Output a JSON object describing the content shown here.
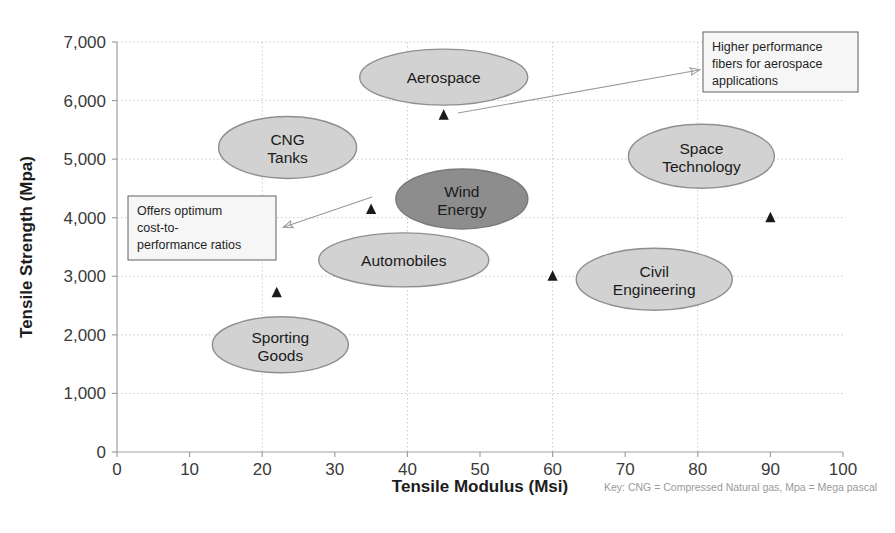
{
  "chart_data": {
    "type": "scatter",
    "title": "",
    "xlabel": "Tensile Modulus (Msi)",
    "ylabel": "Tensile Strength (Mpa)",
    "xlim": [
      0,
      100
    ],
    "ylim": [
      0,
      7000
    ],
    "xticks": [
      "0",
      "10",
      "20",
      "30",
      "40",
      "50",
      "60",
      "70",
      "80",
      "90",
      "100"
    ],
    "yticks": [
      "0",
      "1,000",
      "2,000",
      "3,000",
      "4,000",
      "5,000",
      "6,000",
      "7,000"
    ],
    "grid": true,
    "legend": "none",
    "key_note": "Key: CNG = Compressed Natural gas, Mpa = Mega pascal",
    "bubbles": [
      {
        "label": "Aerospace",
        "line1": "Aerospace",
        "line2": "",
        "x": 45,
        "y": 6400,
        "rx": 84,
        "ry": 28,
        "fill": "#d2d2d2",
        "stroke": "#8f8f8f"
      },
      {
        "label": "CNG Tanks",
        "line1": "CNG",
        "line2": "Tanks",
        "x": 23.5,
        "y": 5200,
        "rx": 69,
        "ry": 31,
        "fill": "#d2d2d2",
        "stroke": "#8f8f8f"
      },
      {
        "label": "Space Technology",
        "line1": "Space",
        "line2": "Technology",
        "x": 80.5,
        "y": 5050,
        "rx": 73,
        "ry": 32,
        "fill": "#d2d2d2",
        "stroke": "#8f8f8f"
      },
      {
        "label": "Wind Energy",
        "line1": "Wind",
        "line2": "Energy",
        "x": 47.5,
        "y": 4320,
        "rx": 66,
        "ry": 30,
        "fill": "#8d8d8d",
        "stroke": "#7a7a7a"
      },
      {
        "label": "Automobiles",
        "line1": "Automobiles",
        "line2": "",
        "x": 39.5,
        "y": 3280,
        "rx": 85,
        "ry": 27,
        "fill": "#d2d2d2",
        "stroke": "#8f8f8f"
      },
      {
        "label": "Civil Engineering",
        "line1": "Civil",
        "line2": "Engineering",
        "x": 74,
        "y": 2950,
        "rx": 78,
        "ry": 31,
        "fill": "#d2d2d2",
        "stroke": "#8f8f8f"
      },
      {
        "label": "Sporting Goods",
        "line1": "Sporting",
        "line2": "Goods",
        "x": 22.5,
        "y": 1830,
        "rx": 68,
        "ry": 28,
        "fill": "#d2d2d2",
        "stroke": "#8f8f8f"
      }
    ],
    "markers": [
      {
        "name": "marker-aerospace",
        "x": 45,
        "y": 5750
      },
      {
        "name": "marker-wind-energy",
        "x": 35,
        "y": 4140
      },
      {
        "name": "marker-space-technology",
        "x": 90,
        "y": 4000
      },
      {
        "name": "marker-civil",
        "x": 60,
        "y": 3000
      },
      {
        "name": "marker-sporting-goods",
        "x": 22,
        "y": 2720
      }
    ],
    "annotations": [
      {
        "name": "callout-cost-performance",
        "lines": [
          "Offers optimum",
          "cost-to-",
          "performance ratios"
        ],
        "box": {
          "x": 128,
          "y": 196,
          "w": 148,
          "h": 64
        },
        "arrow": {
          "x1": 372,
          "y1": 197,
          "x2": 284,
          "y2": 227
        }
      },
      {
        "name": "callout-higher-performance",
        "lines": [
          "Higher performance",
          "fibers for aerospace",
          "applications"
        ],
        "box": {
          "x": 703,
          "y": 32,
          "w": 155,
          "h": 60
        },
        "arrow": {
          "x1": 458,
          "y1": 113,
          "x2": 699,
          "y2": 70
        }
      }
    ],
    "colors": {
      "bubble_light": "#d2d2d2",
      "bubble_dark": "#8d8d8d",
      "bubble_border": "#8f8f8f",
      "grid": "#c9c9c9",
      "axis": "#a0a0a0",
      "marker": "#1a1a1a",
      "callout_border": "#6e6e6e",
      "callout_fill": "#f6f6f6",
      "key_text": "#9a9a9a"
    }
  }
}
